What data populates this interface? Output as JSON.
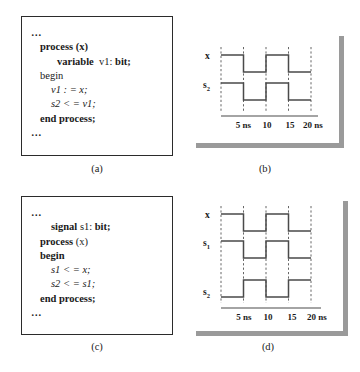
{
  "figure": {
    "panels": [
      {
        "id": "a",
        "caption": "(a)",
        "type": "code",
        "lines": [
          {
            "indent": 0,
            "parts": [
              {
                "text": "…",
                "style": "ellipsis"
              }
            ]
          },
          {
            "indent": 1,
            "parts": [
              {
                "text": "process (x)",
                "style": "bold"
              }
            ]
          },
          {
            "indent": 3,
            "parts": [
              {
                "text": "variable",
                "style": "bold"
              },
              {
                "text": "  v1: ",
                "style": "plain"
              },
              {
                "text": "bit;",
                "style": "bold"
              }
            ]
          },
          {
            "indent": 1,
            "parts": [
              {
                "text": "begin",
                "style": "plain"
              }
            ]
          },
          {
            "indent": 2,
            "parts": [
              {
                "text": "v1 : = x;",
                "style": "italic"
              }
            ]
          },
          {
            "indent": 2,
            "parts": [
              {
                "text": "s2 < = v1;",
                "style": "italic"
              }
            ]
          },
          {
            "indent": 1,
            "parts": [
              {
                "text": "end process;",
                "style": "bold"
              }
            ]
          },
          {
            "indent": 0,
            "parts": [
              {
                "text": "…",
                "style": "ellipsis"
              }
            ]
          }
        ]
      },
      {
        "id": "c",
        "caption": "(c)",
        "type": "code",
        "lines": [
          {
            "indent": 0,
            "parts": [
              {
                "text": "…",
                "style": "ellipsis"
              }
            ]
          },
          {
            "indent": 2,
            "parts": [
              {
                "text": "signal",
                "style": "bold"
              },
              {
                "text": " s1: ",
                "style": "plain"
              },
              {
                "text": "bit;",
                "style": "bold"
              }
            ]
          },
          {
            "indent": 1,
            "parts": [
              {
                "text": "process",
                "style": "bold"
              },
              {
                "text": " (x)",
                "style": "plain"
              }
            ]
          },
          {
            "indent": 1,
            "parts": [
              {
                "text": "begin",
                "style": "bold"
              }
            ]
          },
          {
            "indent": 2,
            "parts": [
              {
                "text": "s1 < = x;",
                "style": "italic"
              }
            ]
          },
          {
            "indent": 2,
            "parts": [
              {
                "text": "s2 < = s1;",
                "style": "italic"
              }
            ]
          },
          {
            "indent": 1,
            "parts": [
              {
                "text": "end process;",
                "style": "bold"
              }
            ]
          },
          {
            "indent": 0,
            "parts": [
              {
                "text": "…",
                "style": "ellipsis"
              }
            ]
          }
        ]
      }
    ],
    "timing_panels": [
      {
        "id": "b",
        "caption": "(b)",
        "time_labels": [
          "5 ns",
          "10",
          "15",
          "20 ns"
        ],
        "signals": [
          {
            "label": "x",
            "subscript": "",
            "levels": [
              1,
              0,
              1,
              0,
              0
            ]
          },
          {
            "label": "s",
            "subscript": "2",
            "levels": [
              1,
              0,
              1,
              0,
              0
            ]
          }
        ]
      },
      {
        "id": "d",
        "caption": "(d)",
        "time_labels": [
          "5 ns",
          "10",
          "15",
          "20 ns"
        ],
        "signals": [
          {
            "label": "x",
            "subscript": "",
            "levels": [
              1,
              0,
              1,
              0,
              0
            ]
          },
          {
            "label": "s",
            "subscript": "1",
            "levels": [
              1,
              0,
              1,
              0,
              0
            ]
          },
          {
            "label": "s",
            "subscript": "2",
            "levels": [
              0,
              1,
              0,
              1,
              1
            ]
          }
        ]
      }
    ]
  },
  "colors": {
    "ink": "#1a1a1a",
    "wave_stroke": "#4a4a4a",
    "grid_dash": "#555555",
    "panel_border": "#2b2b2b",
    "shadow": "#9a9a9a",
    "background": "#ffffff"
  }
}
